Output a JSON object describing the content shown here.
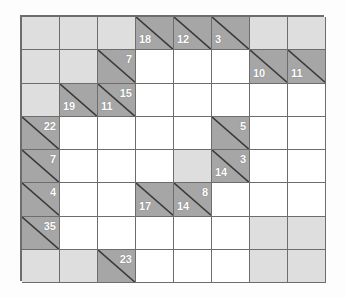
{
  "puzzle": {
    "name": "Kakuro Grid",
    "type": "kakuro",
    "rows": 8,
    "cols": 8,
    "colors": {
      "open_cell": "#ffffff",
      "blocked_cell": "#dedede",
      "clue_cell": "#a6a6a6",
      "grid_line": "#6d6d6d",
      "clue_text": "#ffffff",
      "diagonal": "#3a3a3a",
      "page_background": "#fdfdfd"
    },
    "legend": {
      "across_position": "upper-right",
      "down_position": "lower-left"
    },
    "cells": [
      [
        {
          "kind": "block"
        },
        {
          "kind": "block"
        },
        {
          "kind": "block"
        },
        {
          "kind": "clue",
          "down": "18"
        },
        {
          "kind": "clue",
          "down": "12"
        },
        {
          "kind": "clue",
          "down": "3"
        },
        {
          "kind": "block"
        },
        {
          "kind": "block"
        }
      ],
      [
        {
          "kind": "block"
        },
        {
          "kind": "block"
        },
        {
          "kind": "clue",
          "across": "7"
        },
        {
          "kind": "open"
        },
        {
          "kind": "open"
        },
        {
          "kind": "open"
        },
        {
          "kind": "clue",
          "down": "10"
        },
        {
          "kind": "clue",
          "down": "11"
        }
      ],
      [
        {
          "kind": "block"
        },
        {
          "kind": "clue",
          "down": "19"
        },
        {
          "kind": "clue",
          "across": "15",
          "down": "11"
        },
        {
          "kind": "open"
        },
        {
          "kind": "open"
        },
        {
          "kind": "open"
        },
        {
          "kind": "open"
        },
        {
          "kind": "open"
        }
      ],
      [
        {
          "kind": "clue",
          "across": "22"
        },
        {
          "kind": "open"
        },
        {
          "kind": "open"
        },
        {
          "kind": "open"
        },
        {
          "kind": "open"
        },
        {
          "kind": "clue",
          "across": "5"
        },
        {
          "kind": "open"
        },
        {
          "kind": "open"
        }
      ],
      [
        {
          "kind": "clue",
          "across": "7"
        },
        {
          "kind": "open"
        },
        {
          "kind": "open"
        },
        {
          "kind": "open"
        },
        {
          "kind": "block"
        },
        {
          "kind": "clue",
          "across": "3",
          "down": "14"
        },
        {
          "kind": "open"
        },
        {
          "kind": "open"
        }
      ],
      [
        {
          "kind": "clue",
          "across": "4"
        },
        {
          "kind": "open"
        },
        {
          "kind": "open"
        },
        {
          "kind": "clue",
          "down": "17"
        },
        {
          "kind": "clue",
          "across": "8",
          "down": "14"
        },
        {
          "kind": "open"
        },
        {
          "kind": "open"
        },
        {
          "kind": "open"
        }
      ],
      [
        {
          "kind": "clue",
          "across": "35"
        },
        {
          "kind": "open"
        },
        {
          "kind": "open"
        },
        {
          "kind": "open"
        },
        {
          "kind": "open"
        },
        {
          "kind": "open"
        },
        {
          "kind": "block"
        },
        {
          "kind": "block"
        }
      ],
      [
        {
          "kind": "block"
        },
        {
          "kind": "block"
        },
        {
          "kind": "clue",
          "across": "23"
        },
        {
          "kind": "open"
        },
        {
          "kind": "open"
        },
        {
          "kind": "open"
        },
        {
          "kind": "block"
        },
        {
          "kind": "block"
        }
      ]
    ]
  }
}
